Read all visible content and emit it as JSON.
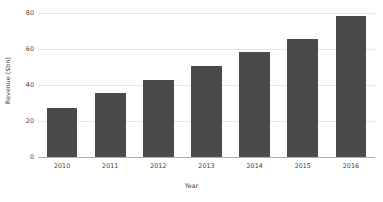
{
  "chart_data": {
    "type": "bar",
    "title": "",
    "xlabel": "Year",
    "ylabel": "Revenue ($bn)",
    "categories": [
      "2010",
      "2011",
      "2012",
      "2013",
      "2014",
      "2015",
      "2016"
    ],
    "values": [
      27.5,
      35.5,
      43,
      50.5,
      58.5,
      65.5,
      78.5
    ],
    "series": [
      {
        "name": "Revenue",
        "values": [
          27.5,
          35.5,
          43,
          50.5,
          58.5,
          65.5,
          78.5
        ]
      }
    ],
    "ylim": [
      0,
      80
    ],
    "yticks": [
      0,
      20,
      40,
      60,
      80
    ],
    "ytick_labels": [
      "0",
      "20",
      "40",
      "60",
      "80"
    ],
    "grid": "horizontal",
    "legend": "none",
    "bar_color": "#4a4a4a",
    "gridline_color": "#e6e6e6",
    "axis_color": "#b0b0b0",
    "background_color": "#ffffff"
  }
}
